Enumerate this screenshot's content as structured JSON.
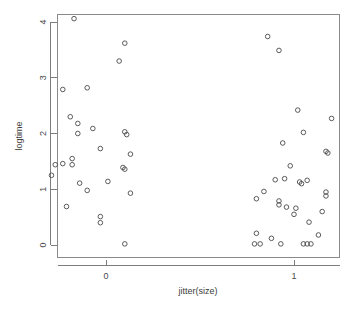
{
  "chart_data": {
    "type": "scatter",
    "title": "",
    "xlabel": "jitter(size)",
    "ylabel": "logtime",
    "xlim": [
      -0.32,
      1.25
    ],
    "ylim": [
      -0.12,
      4.18
    ],
    "xticks": [
      0,
      1
    ],
    "xtick_labels": [
      "0",
      "1"
    ],
    "yticks": [
      0,
      1,
      2,
      3,
      4
    ],
    "ytick_labels": [
      "0",
      "1",
      "2",
      "3",
      "4"
    ],
    "grid": false,
    "legend": null,
    "marker": "open-circle",
    "marker_color": "#4a4a4a",
    "points": [
      {
        "x": -0.17,
        "y": 4.06
      },
      {
        "x": 0.1,
        "y": 3.62
      },
      {
        "x": 0.07,
        "y": 3.3
      },
      {
        "x": -0.23,
        "y": 2.79
      },
      {
        "x": -0.1,
        "y": 2.82
      },
      {
        "x": -0.19,
        "y": 2.3
      },
      {
        "x": -0.15,
        "y": 2.18
      },
      {
        "x": -0.15,
        "y": 2.0
      },
      {
        "x": -0.07,
        "y": 2.09
      },
      {
        "x": 0.1,
        "y": 2.03
      },
      {
        "x": 0.11,
        "y": 1.98
      },
      {
        "x": -0.03,
        "y": 1.73
      },
      {
        "x": 0.13,
        "y": 1.63
      },
      {
        "x": -0.27,
        "y": 1.44
      },
      {
        "x": -0.23,
        "y": 1.46
      },
      {
        "x": -0.18,
        "y": 1.55
      },
      {
        "x": -0.18,
        "y": 1.44
      },
      {
        "x": -0.29,
        "y": 1.25
      },
      {
        "x": -0.14,
        "y": 1.11
      },
      {
        "x": 0.01,
        "y": 1.14
      },
      {
        "x": 0.09,
        "y": 1.39
      },
      {
        "x": 0.1,
        "y": 1.36
      },
      {
        "x": -0.1,
        "y": 0.98
      },
      {
        "x": 0.13,
        "y": 0.93
      },
      {
        "x": -0.21,
        "y": 0.69
      },
      {
        "x": -0.03,
        "y": 0.51
      },
      {
        "x": -0.03,
        "y": 0.4
      },
      {
        "x": 0.1,
        "y": 0.02
      },
      {
        "x": 0.86,
        "y": 3.74
      },
      {
        "x": 0.92,
        "y": 3.49
      },
      {
        "x": 1.02,
        "y": 2.42
      },
      {
        "x": 1.2,
        "y": 2.27
      },
      {
        "x": 1.05,
        "y": 2.02
      },
      {
        "x": 0.94,
        "y": 1.83
      },
      {
        "x": 1.17,
        "y": 1.68
      },
      {
        "x": 1.18,
        "y": 1.65
      },
      {
        "x": 0.98,
        "y": 1.42
      },
      {
        "x": 0.9,
        "y": 1.17
      },
      {
        "x": 0.95,
        "y": 1.19
      },
      {
        "x": 1.03,
        "y": 1.13
      },
      {
        "x": 1.04,
        "y": 1.1
      },
      {
        "x": 1.07,
        "y": 1.16
      },
      {
        "x": 0.84,
        "y": 0.96
      },
      {
        "x": 1.17,
        "y": 0.95
      },
      {
        "x": 1.17,
        "y": 0.88
      },
      {
        "x": 0.8,
        "y": 0.83
      },
      {
        "x": 0.92,
        "y": 0.79
      },
      {
        "x": 0.92,
        "y": 0.72
      },
      {
        "x": 0.96,
        "y": 0.68
      },
      {
        "x": 1.01,
        "y": 0.66
      },
      {
        "x": 1.0,
        "y": 0.55
      },
      {
        "x": 1.15,
        "y": 0.6
      },
      {
        "x": 1.08,
        "y": 0.41
      },
      {
        "x": 0.8,
        "y": 0.21
      },
      {
        "x": 0.88,
        "y": 0.12
      },
      {
        "x": 1.13,
        "y": 0.18
      },
      {
        "x": 0.79,
        "y": 0.02
      },
      {
        "x": 0.82,
        "y": 0.02
      },
      {
        "x": 0.93,
        "y": 0.02
      },
      {
        "x": 1.05,
        "y": 0.02
      },
      {
        "x": 1.07,
        "y": 0.02
      },
      {
        "x": 1.09,
        "y": 0.02
      }
    ]
  }
}
